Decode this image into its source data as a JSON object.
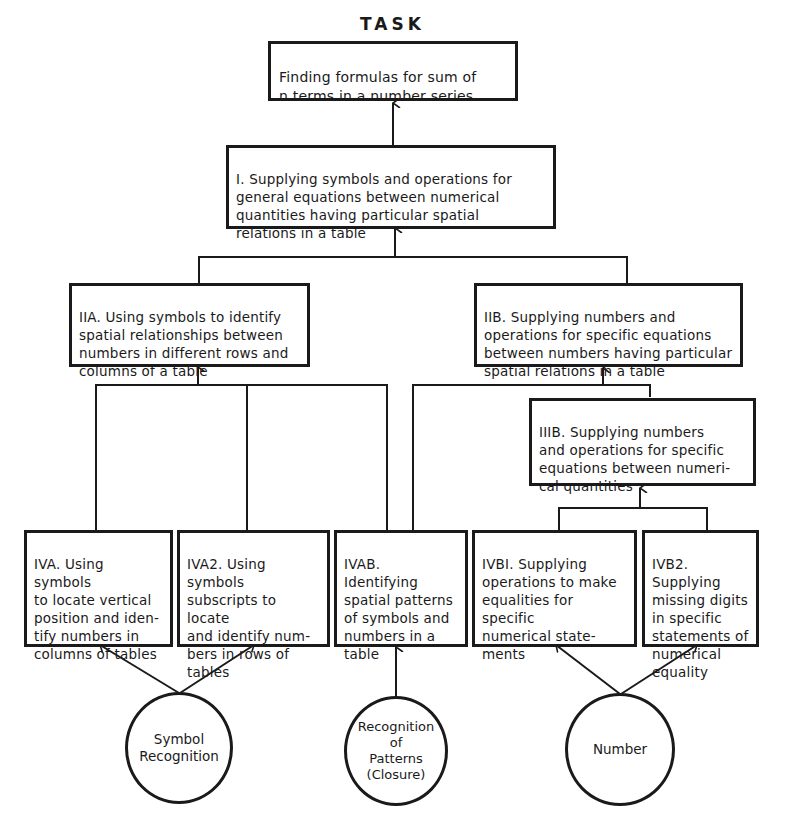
{
  "diagram": {
    "title": "TASK",
    "task": {
      "id": "task",
      "text": "Finding formulas for sum of\nn terms in a number series"
    },
    "level1": {
      "id": "I",
      "text": "I. Supplying symbols and operations for\ngeneral equations between numerical\nquantities having particular spatial\nrelations in a table"
    },
    "level2": [
      {
        "id": "IIA",
        "text": "IIA. Using symbols to identify\nspatial relationships between\nnumbers in different rows and\ncolumns of a table"
      },
      {
        "id": "IIB",
        "text": "IIB. Supplying numbers and\noperations for specific equations\nbetween numbers having particular\nspatial relations in a table"
      }
    ],
    "level3": [
      {
        "id": "IIIB",
        "text": "IIIB. Supplying numbers\nand operations for specific\nequations between numeri-\ncal quantities"
      }
    ],
    "level4": [
      {
        "id": "IVA",
        "text": "IVA. Using symbols\nto locate vertical\nposition and iden-\ntify numbers in\ncolumns of tables"
      },
      {
        "id": "IVA2",
        "text": "IVA2. Using symbols\nsubscripts to locate\nand identify num-\nbers in rows of\ntables"
      },
      {
        "id": "IVAB",
        "text": "IVAB. Identifying\nspatial patterns\nof symbols and\nnumbers in a\ntable"
      },
      {
        "id": "IVB1",
        "text": "IVBI. Supplying\noperations to make\nequalities for specific\nnumerical state-\nments"
      },
      {
        "id": "IVB2",
        "text": "IVB2. Supplying\nmissing digits\nin specific\nstatements of\nnumerical\nequality"
      }
    ],
    "foundations": [
      {
        "id": "symbol-recognition",
        "text": "Symbol\nRecognition"
      },
      {
        "id": "pattern-recognition",
        "text": "Recognition\nof\nPatterns\n(Closure)"
      },
      {
        "id": "number",
        "text": "Number"
      }
    ],
    "edges": [
      {
        "from": "I",
        "to": "task"
      },
      {
        "from": "IIA",
        "to": "I"
      },
      {
        "from": "IIB",
        "to": "I"
      },
      {
        "from": "IVA",
        "to": "IIA"
      },
      {
        "from": "IVA2",
        "to": "IIA"
      },
      {
        "from": "IVAB",
        "to": "IIA"
      },
      {
        "from": "IVAB",
        "to": "IIB"
      },
      {
        "from": "IIIB",
        "to": "IIB"
      },
      {
        "from": "IVB1",
        "to": "IIIB"
      },
      {
        "from": "IVB2",
        "to": "IIIB"
      },
      {
        "from": "symbol-recognition",
        "to": "IVA"
      },
      {
        "from": "symbol-recognition",
        "to": "IVA2"
      },
      {
        "from": "pattern-recognition",
        "to": "IVAB"
      },
      {
        "from": "number",
        "to": "IVB1"
      },
      {
        "from": "number",
        "to": "IVB2"
      }
    ],
    "colors": {
      "ink": "#1a1a1a",
      "paper": "#ffffff"
    }
  }
}
